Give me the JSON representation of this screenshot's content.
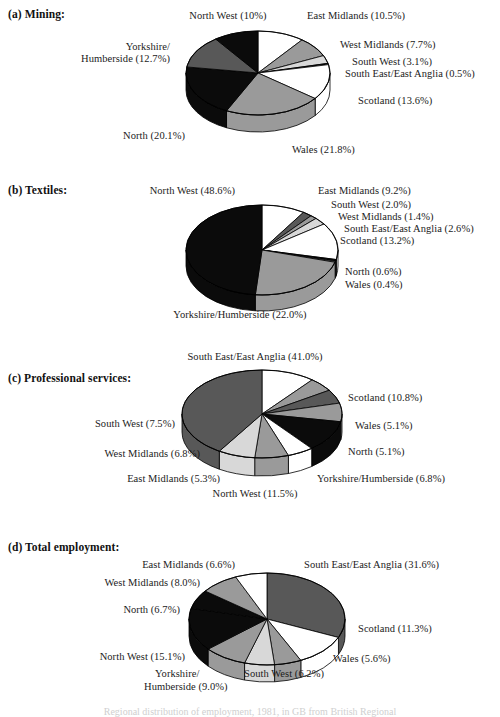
{
  "figure": {
    "background": "#ffffff",
    "line_color": "#000000",
    "caption_partial": "Regional distribution of employment, 1981, in GB from British Regional"
  },
  "palette": {
    "white": "#ffffff",
    "light_gray": "#d8d8d8",
    "mid_gray": "#9a9a9a",
    "dark_gray": "#585858",
    "black": "#0b0b0b",
    "edge": "#000000"
  },
  "panels": [
    {
      "key": "a",
      "title": "(a)  Mining:",
      "labels": {
        "north_west": "North West (10%)",
        "east_midlands": "East Midlands (10.5%)",
        "west_midlands": "West Midlands (7.7%)",
        "south_west": "South West (3.1%)",
        "south_east": "South East/East Anglia (0.5%)",
        "scotland": "Scotland (13.6%)",
        "wales": "Wales (21.8%)",
        "north": "North (20.1%)",
        "yorkshire_l1": "Yorkshire/",
        "yorkshire_l2": "Humberside (12.7%)"
      }
    },
    {
      "key": "b",
      "title": "(b)  Textiles:",
      "labels": {
        "north_west": "North West (48.6%)",
        "east_midlands": "East Midlands (9.2%)",
        "south_west": "South West (2.0%)",
        "west_midlands": "West Midlands (1.4%)",
        "south_east": "South East/East Anglia (2.6%)",
        "scotland": "Scotland (13.2%)",
        "north": "North (0.6%)",
        "wales": "Wales (0.4%)",
        "yorkshire": "Yorkshire/Humberside (22.0%)"
      }
    },
    {
      "key": "c",
      "title": "(c)  Professional services:",
      "labels": {
        "south_east": "South East/East Anglia (41.0%)",
        "scotland": "Scotland (10.8%)",
        "wales": "Wales (5.1%)",
        "north": "North (5.1%)",
        "yorkshire": "Yorkshire/Humberside (6.8%)",
        "north_west": "North West (11.5%)",
        "east_midlands": "East Midlands (5.3%)",
        "west_midlands": "West Midlands (6.8%)",
        "south_west": "South West (7.5%)"
      }
    },
    {
      "key": "d",
      "title": "(d)  Total employment:",
      "labels": {
        "east_midlands": "East Midlands (6.6%)",
        "south_east": "South East/East Anglia (31.6%)",
        "west_midlands": "West Midlands (8.0%)",
        "north": "North (6.7%)",
        "scotland": "Scotland (11.3%)",
        "north_west": "North West (15.1%)",
        "wales": "Wales (5.6%)",
        "south_west": "South West (6.2%)",
        "yorkshire_l1": "Yorkshire/",
        "yorkshire_l2": "Humberside (9.0%)"
      }
    }
  ],
  "chart_data": [
    {
      "type": "pie",
      "id": "a",
      "title": "(a)  Mining:",
      "unit": "percent",
      "start_angle_deg": -90,
      "direction": "clockwise",
      "three_d": true,
      "categories": [
        "East Midlands",
        "West Midlands",
        "South West",
        "South East/East Anglia",
        "Scotland",
        "Wales",
        "North",
        "Yorkshire/Humberside",
        "North West"
      ],
      "values": [
        10.5,
        7.7,
        3.1,
        0.5,
        13.6,
        21.8,
        20.1,
        12.7,
        10.0
      ],
      "colors": [
        "#ffffff",
        "#9a9a9a",
        "#d8d8d8",
        "#0b0b0b",
        "#ffffff",
        "#9a9a9a",
        "#0b0b0b",
        "#585858",
        "#0b0b0b"
      ]
    },
    {
      "type": "pie",
      "id": "b",
      "title": "(b)  Textiles:",
      "unit": "percent",
      "start_angle_deg": -90,
      "direction": "clockwise",
      "three_d": true,
      "categories": [
        "East Midlands",
        "South West",
        "West Midlands",
        "South East/East Anglia",
        "Scotland",
        "North",
        "Wales",
        "Yorkshire/Humberside",
        "North West"
      ],
      "values": [
        9.2,
        2.0,
        1.4,
        2.6,
        13.2,
        0.6,
        0.4,
        22.0,
        48.6
      ],
      "colors": [
        "#ffffff",
        "#585858",
        "#9a9a9a",
        "#d8d8d8",
        "#ffffff",
        "#0b0b0b",
        "#9a9a9a",
        "#9a9a9a",
        "#0b0b0b"
      ]
    },
    {
      "type": "pie",
      "id": "c",
      "title": "(c)  Professional services:",
      "unit": "percent",
      "start_angle_deg": -90,
      "direction": "clockwise",
      "three_d": true,
      "categories": [
        "Scotland",
        "Wales",
        "North",
        "Yorkshire/Humberside",
        "North West",
        "East Midlands",
        "West Midlands",
        "South West",
        "South East/East Anglia"
      ],
      "values": [
        10.8,
        5.1,
        5.1,
        6.8,
        11.5,
        5.3,
        6.8,
        7.5,
        41.0
      ],
      "colors": [
        "#ffffff",
        "#9a9a9a",
        "#585858",
        "#9a9a9a",
        "#0b0b0b",
        "#ffffff",
        "#9a9a9a",
        "#d8d8d8",
        "#585858"
      ]
    },
    {
      "type": "pie",
      "id": "d",
      "title": "(d)  Total employment:",
      "unit": "percent",
      "start_angle_deg": -90,
      "direction": "clockwise",
      "three_d": true,
      "categories": [
        "South East/East Anglia",
        "Scotland",
        "Wales",
        "South West",
        "Yorkshire/Humberside",
        "North West",
        "North",
        "West Midlands",
        "East Midlands"
      ],
      "values": [
        31.6,
        11.3,
        5.6,
        6.2,
        9.0,
        15.1,
        6.7,
        8.0,
        6.6
      ],
      "colors": [
        "#585858",
        "#ffffff",
        "#9a9a9a",
        "#d8d8d8",
        "#9a9a9a",
        "#0b0b0b",
        "#0b0b0b",
        "#9a9a9a",
        "#ffffff"
      ]
    }
  ]
}
